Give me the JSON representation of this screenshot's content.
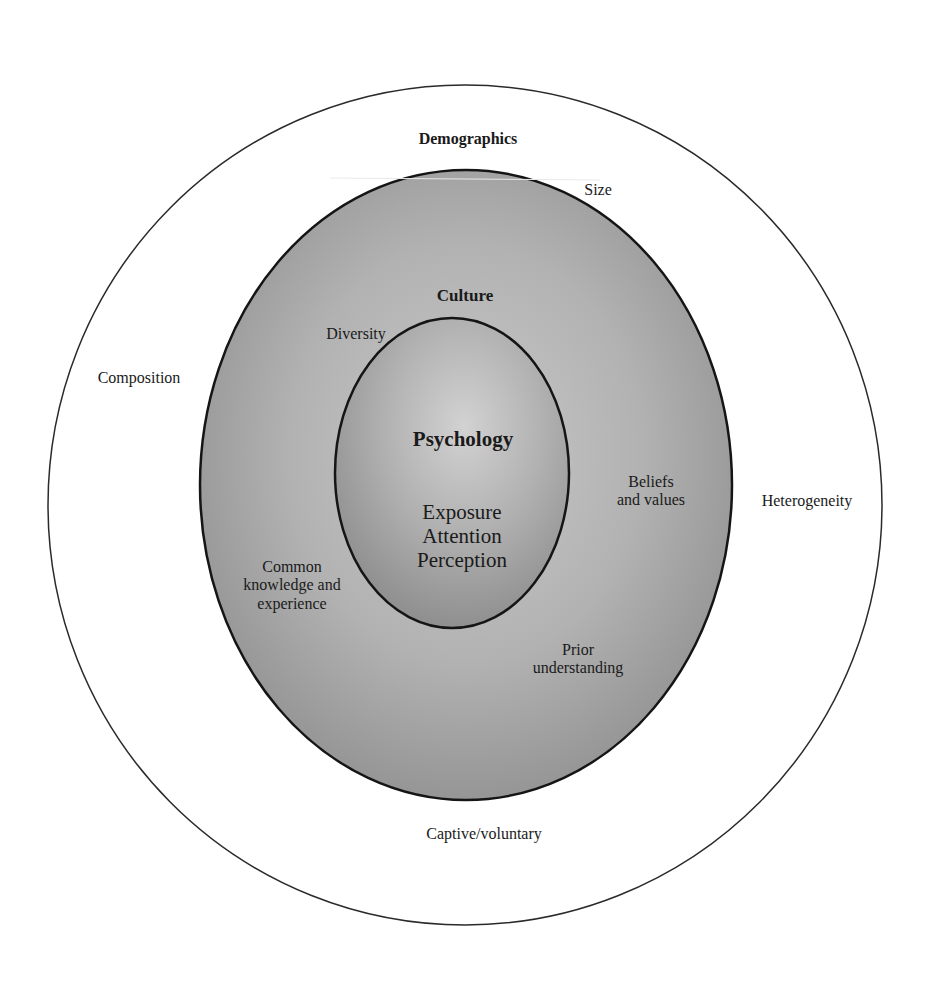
{
  "diagram": {
    "type": "concentric-circles",
    "layers": {
      "outer": {
        "title": "Demographics",
        "items": {
          "size": "Size",
          "composition": "Composition",
          "heterogeneity": "Heterogeneity",
          "captive": "Captive/voluntary"
        },
        "fill": "#ffffff",
        "stroke": "#333333"
      },
      "middle": {
        "title": "Culture",
        "items": {
          "diversity": "Diversity",
          "beliefs_line1": "Beliefs",
          "beliefs_line2": "and values",
          "common_line1": "Common",
          "common_line2": "knowledge and",
          "common_line3": "experience",
          "prior_line1": "Prior",
          "prior_line2": "understanding"
        },
        "fill": "#a8a8a8",
        "stroke": "#1a1a1a"
      },
      "inner": {
        "title": "Psychology",
        "items": {
          "exposure": "Exposure",
          "attention": "Attention",
          "perception": "Perception"
        },
        "fill": "#b4b4b4",
        "stroke": "#1a1a1a"
      }
    }
  }
}
